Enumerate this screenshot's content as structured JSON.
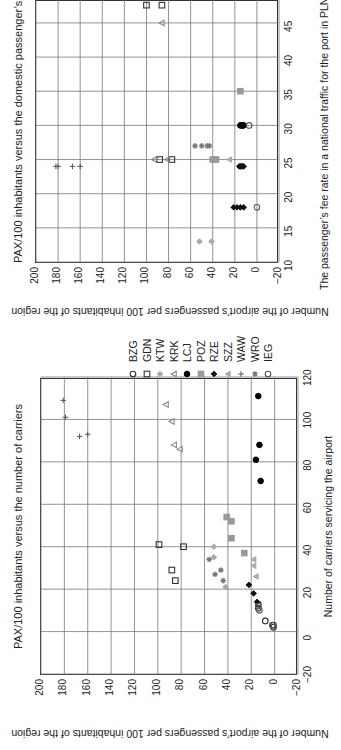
{
  "chart_data": [
    {
      "id": "carriers",
      "type": "scatter",
      "title": "PAX/100 inhabitants versus the number of carriers",
      "xlabel": "Number of carriers servicing the airport",
      "ylabel": "Number of the airport’s passengers per 100 inhabitants of the region",
      "xlim": [
        -20,
        120
      ],
      "ylim": [
        -20,
        200
      ],
      "xticks": [
        -20,
        0,
        20,
        40,
        60,
        80,
        100,
        120
      ],
      "yticks": [
        -20,
        0,
        20,
        40,
        60,
        80,
        100,
        120,
        140,
        160,
        180,
        200
      ],
      "grid": true,
      "series": [
        {
          "name": "BZG",
          "points": [
            [
              11,
              14
            ],
            [
              13,
              14
            ],
            [
              5,
              8
            ],
            [
              2,
              1
            ],
            [
              3,
              1
            ]
          ]
        },
        {
          "name": "GDN",
          "points": [
            [
              41,
              99
            ],
            [
              40,
              78
            ],
            [
              29,
              88
            ],
            [
              24,
              85
            ]
          ]
        },
        {
          "name": "KTW",
          "points": [
            [
              40,
              52
            ],
            [
              35,
              52
            ],
            [
              21,
              42
            ]
          ]
        },
        {
          "name": "KRK",
          "points": [
            [
              107,
              93
            ],
            [
              99,
              88
            ],
            [
              88,
              86
            ],
            [
              86,
              81
            ]
          ]
        },
        {
          "name": "LCJ",
          "points": [
            [
              111,
              14
            ],
            [
              88,
              13
            ],
            [
              81,
              16
            ],
            [
              71,
              12
            ]
          ]
        },
        {
          "name": "POZ",
          "points": [
            [
              54,
              41
            ],
            [
              52,
              37
            ],
            [
              44,
              37
            ],
            [
              37,
              26
            ]
          ]
        },
        {
          "name": "RZE",
          "points": [
            [
              22,
              22
            ],
            [
              18,
              18
            ],
            [
              14,
              15
            ]
          ]
        },
        {
          "name": "SZZ",
          "points": [
            [
              34,
              18
            ],
            [
              31,
              18
            ],
            [
              26,
              16
            ]
          ]
        },
        {
          "name": "WAW",
          "points": [
            [
              109,
              181
            ],
            [
              101,
              179
            ],
            [
              92,
              167
            ],
            [
              93,
              160
            ]
          ]
        },
        {
          "name": "WRO",
          "points": [
            [
              34,
              56
            ],
            [
              27,
              51
            ],
            [
              29,
              46
            ],
            [
              24,
              44
            ]
          ]
        },
        {
          "name": "IEG",
          "points": [
            [
              12,
              14
            ],
            [
              10,
              13
            ],
            [
              3,
              2
            ]
          ]
        }
      ]
    },
    {
      "id": "fee",
      "type": "scatter",
      "title": "PAX/100 inhabitants versus the domestic passenger’s fee",
      "xlabel": "The passenger’s fee rate in a national traffic for the port in PLN",
      "ylabel": "Number of the airport’s passengers per 100 inhabitants of the region",
      "xlim": [
        10,
        48.5
      ],
      "ylim": [
        -20,
        200
      ],
      "xticks": [
        10,
        15,
        20,
        25,
        30,
        35,
        40,
        45
      ],
      "yticks": [
        -20,
        0,
        20,
        40,
        60,
        80,
        100,
        120,
        140,
        160,
        180,
        200
      ],
      "grid": true,
      "series": [
        {
          "name": "BZG",
          "points": []
        },
        {
          "name": "GDN",
          "points": [
            [
              47.6,
              100
            ],
            [
              47.6,
              86
            ],
            [
              25,
              88
            ],
            [
              25,
              77
            ]
          ]
        },
        {
          "name": "KTW",
          "points": [
            [
              13,
              52
            ],
            [
              13,
              41
            ]
          ]
        },
        {
          "name": "KRK",
          "points": [
            [
              45,
              86
            ],
            [
              25,
              93
            ],
            [
              25,
              81
            ]
          ]
        },
        {
          "name": "LCJ",
          "points": [
            [
              30,
              15
            ],
            [
              30,
              14
            ],
            [
              30,
              13
            ],
            [
              30,
              12
            ]
          ]
        },
        {
          "name": "POZ",
          "points": [
            [
              25,
              40
            ],
            [
              25,
              37
            ],
            [
              35,
              15
            ]
          ]
        },
        {
          "name": "RZE",
          "points": [
            [
              24,
              16
            ],
            [
              24,
              15
            ],
            [
              24,
              14
            ],
            [
              24,
              13
            ],
            [
              24,
              12
            ],
            [
              18,
              21
            ],
            [
              18,
              18
            ],
            [
              18,
              15
            ],
            [
              18,
              12
            ]
          ]
        },
        {
          "name": "SZZ",
          "points": [
            [
              25,
              25
            ]
          ]
        },
        {
          "name": "WAW",
          "points": [
            [
              24,
              182
            ],
            [
              24,
              180
            ],
            [
              24,
              167
            ],
            [
              24,
              160
            ]
          ]
        },
        {
          "name": "WRO",
          "points": [
            [
              27,
              56
            ],
            [
              27,
              50
            ],
            [
              27,
              45
            ],
            [
              27,
              43
            ]
          ]
        },
        {
          "name": "IEG",
          "points": [
            [
              30,
              7
            ],
            [
              18,
              0
            ]
          ]
        }
      ]
    }
  ],
  "legend": {
    "items": [
      {
        "label": "BZG",
        "marker": "circle-open",
        "color": "#333333"
      },
      {
        "label": "GDN",
        "marker": "square-open",
        "color": "#333333"
      },
      {
        "label": "KTW",
        "marker": "diamond-filled",
        "color": "#aaaaaa"
      },
      {
        "label": "KRK",
        "marker": "triangle-open",
        "color": "#888888"
      },
      {
        "label": "LCJ",
        "marker": "circle-filled",
        "color": "#000000"
      },
      {
        "label": "POZ",
        "marker": "square-filled",
        "color": "#999999"
      },
      {
        "label": "RZE",
        "marker": "diamond-filled",
        "color": "#111111"
      },
      {
        "label": "SZZ",
        "marker": "triangle-filled",
        "color": "#aaaaaa"
      },
      {
        "label": "WAW",
        "marker": "plus",
        "color": "#555555"
      },
      {
        "label": "WRO",
        "marker": "star",
        "color": "#777777"
      },
      {
        "label": "IEG",
        "marker": "circle-open",
        "color": "#555555"
      }
    ]
  }
}
